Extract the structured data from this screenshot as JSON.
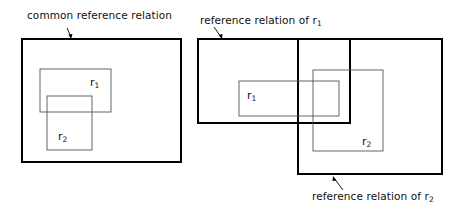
{
  "left_diagram": {
    "caption": "common reference relation",
    "inner_rects": [
      {
        "name": "r",
        "subscript": "1"
      },
      {
        "name": "r",
        "subscript": "2"
      }
    ]
  },
  "right_diagram": {
    "caption_top": {
      "text": "reference relation  of r",
      "subscript": "1"
    },
    "caption_bottom": {
      "text": "reference relation  of r",
      "subscript": "2"
    },
    "inner_rects": [
      {
        "name": "r",
        "subscript": "1"
      },
      {
        "name": "r",
        "subscript": "2"
      }
    ]
  },
  "colors": {
    "stroke_thick": "#000000",
    "stroke_thin": "#555555",
    "background": "#ffffff"
  }
}
